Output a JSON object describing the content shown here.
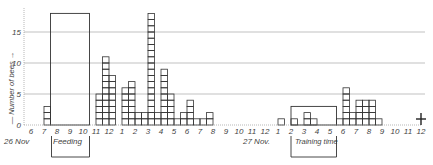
{
  "chart_data": {
    "type": "bar",
    "title": "",
    "xlabel": "",
    "ylabel": "Number of bees",
    "ylim": [
      0,
      18
    ],
    "yticks": [
      0,
      5,
      10,
      15
    ],
    "grid": "horizontal at 5, 10, 15",
    "bin_width_hours": 0.5,
    "x_tick_labels": [
      "6",
      "7",
      "8",
      "9",
      "10",
      "11",
      "12",
      "1",
      "2",
      "3",
      "4",
      "5",
      "6",
      "7",
      "8",
      "9",
      "10",
      "11",
      "12",
      "1",
      "2",
      "3",
      "4",
      "5",
      "6",
      "7",
      "8",
      "9",
      "10",
      "11",
      "12"
    ],
    "date_labels": [
      {
        "label": "26 Nov",
        "at_tick": 0
      },
      {
        "label": "27 Nov.",
        "at_tick": 19
      }
    ],
    "annotations": [
      {
        "label": "Feeding",
        "from_tick": 1.5,
        "to_tick": 4.5,
        "type": "bracket-below"
      },
      {
        "label": "Training time",
        "from_tick": 20,
        "to_tick": 23.5,
        "type": "bracket-below"
      },
      {
        "label": "Feeding period box",
        "from_tick": 1.5,
        "to_tick": 4.5,
        "height": 18
      },
      {
        "label": "Training period box",
        "from_tick": 20,
        "to_tick": 23.5,
        "height": 3
      },
      {
        "label": "cross marker",
        "at_tick": 30
      }
    ],
    "bars": [
      {
        "start_tick": 1.0,
        "value": 3
      },
      {
        "start_tick": 5.0,
        "value": 5
      },
      {
        "start_tick": 5.5,
        "value": 11
      },
      {
        "start_tick": 6.0,
        "value": 8
      },
      {
        "start_tick": 7.0,
        "value": 6
      },
      {
        "start_tick": 7.5,
        "value": 7
      },
      {
        "start_tick": 8.0,
        "value": 2
      },
      {
        "start_tick": 8.5,
        "value": 2
      },
      {
        "start_tick": 9.0,
        "value": 18
      },
      {
        "start_tick": 9.5,
        "value": 2
      },
      {
        "start_tick": 10.0,
        "value": 9
      },
      {
        "start_tick": 10.5,
        "value": 5
      },
      {
        "start_tick": 11.0,
        "value": 1
      },
      {
        "start_tick": 11.5,
        "value": 2
      },
      {
        "start_tick": 12.0,
        "value": 4
      },
      {
        "start_tick": 12.5,
        "value": 1
      },
      {
        "start_tick": 13.0,
        "value": 1
      },
      {
        "start_tick": 13.5,
        "value": 2
      },
      {
        "start_tick": 19.0,
        "value": 1
      },
      {
        "start_tick": 20.0,
        "value": 1
      },
      {
        "start_tick": 21.0,
        "value": 2
      },
      {
        "start_tick": 21.5,
        "value": 1
      },
      {
        "start_tick": 23.5,
        "value": 1
      },
      {
        "start_tick": 24.0,
        "value": 6
      },
      {
        "start_tick": 24.5,
        "value": 2
      },
      {
        "start_tick": 25.0,
        "value": 4
      },
      {
        "start_tick": 25.5,
        "value": 4
      },
      {
        "start_tick": 26.0,
        "value": 4
      },
      {
        "start_tick": 26.5,
        "value": 1
      }
    ]
  },
  "labels": {
    "ylabel": "— Number of bees →",
    "feeding": "Feeding",
    "training": "Training time",
    "date1": "26 Nov",
    "date2": "27 Nov."
  }
}
